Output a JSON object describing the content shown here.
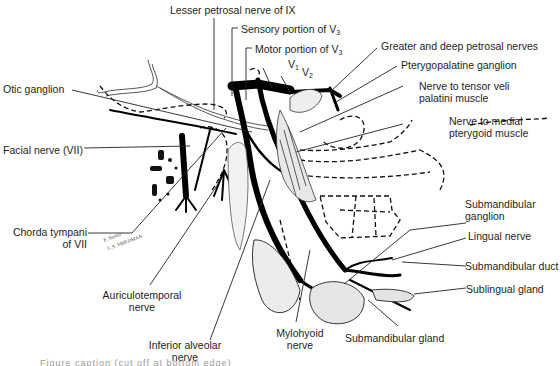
{
  "figure": {
    "labels": {
      "lesser_petrosal": "Lesser petrosal nerve of IX",
      "sensory_v3": {
        "text": "Sensory portion of V",
        "sub": "3"
      },
      "motor_v3": {
        "text": "Motor portion of V",
        "sub": "3"
      },
      "v1": {
        "text": "V",
        "sub": "1"
      },
      "v2": {
        "text": "V",
        "sub": "2"
      },
      "greater_deep_petrosal": "Greater and deep petrosal nerves",
      "pterygopalatine_ganglion": "Pterygopalatine ganglion",
      "nerve_tensor_veli": [
        "Nerve to tensor veli",
        "palatini muscle"
      ],
      "nerve_medial_pterygoid": [
        "Nerve to medial",
        "pterygoid muscle"
      ],
      "otic_ganglion": "Otic ganglion",
      "facial_nerve": "Facial nerve (VII)",
      "chorda_tympani": [
        "Chorda tympani",
        "of VII"
      ],
      "auriculotemporal": [
        "Auriculotemporal",
        "nerve"
      ],
      "inferior_alveolar": [
        "Inferior alveolar",
        "nerve"
      ],
      "mylohyoid": [
        "Mylohyoid",
        "nerve"
      ],
      "submandibular_gland": "Submandibular gland",
      "submandibular_ganglion": [
        "Submandibular",
        "ganglion"
      ],
      "lingual_nerve": "Lingual nerve",
      "submandibular_duct": "Submandibular duct",
      "sublingual_gland": "Sublingual gland"
    },
    "signature": [
      "F. Netter",
      "C.A. FRIEDMAN"
    ],
    "caption_cut": "Figure caption (cut off at bottom edge)"
  }
}
